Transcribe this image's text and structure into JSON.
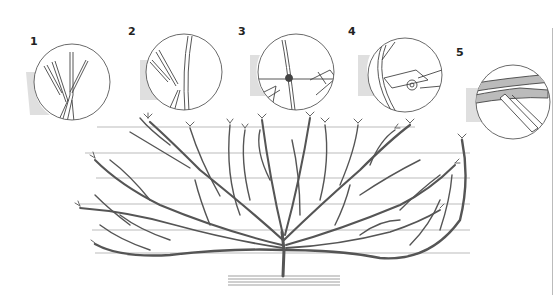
{
  "figure": {
    "line_color": "#444444",
    "wire_color": "#aaaaaa",
    "background": "#ffffff"
  },
  "steps": [
    {
      "number": "1",
      "depiction": "young shoots forking from a stem"
    },
    {
      "number": "2",
      "depiction": "side branch growing from a main stem"
    },
    {
      "number": "3",
      "depiction": "shoot tied to a support wire"
    },
    {
      "number": "4",
      "depiction": "secateurs cutting a shoot"
    },
    {
      "number": "5",
      "depiction": "pruning saw cutting a thick branch"
    }
  ],
  "wires": {
    "count": 6,
    "y": [
      127,
      153,
      178,
      204,
      230,
      253
    ]
  }
}
